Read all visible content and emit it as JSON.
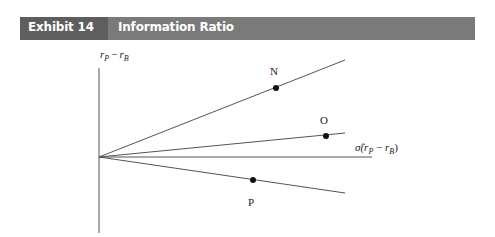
{
  "header": {
    "label": "Exhibit 14",
    "title": "Information Ratio"
  },
  "diagram": {
    "y_axis_label_main": "r",
    "y_axis_label_sub1": "P",
    "y_axis_label_minus": "−",
    "y_axis_label_main2": "r",
    "y_axis_label_sub2": "B",
    "x_axis_label_prefix": "σ̂(",
    "x_axis_label_r1": "r",
    "x_axis_label_sub1": "P",
    "x_axis_label_minus": " − ",
    "x_axis_label_r2": "r",
    "x_axis_label_sub2": "B",
    "x_axis_label_suffix": ")",
    "points": [
      {
        "label": "N",
        "x": 276,
        "y": 88
      },
      {
        "label": "O",
        "x": 326,
        "y": 136
      },
      {
        "label": "P",
        "x": 253,
        "y": 180
      }
    ],
    "colors": {
      "header_bg": "#7a7a7a",
      "header_label_bg": "#5e5e5e",
      "line": "#555555",
      "point": "#111111"
    }
  }
}
